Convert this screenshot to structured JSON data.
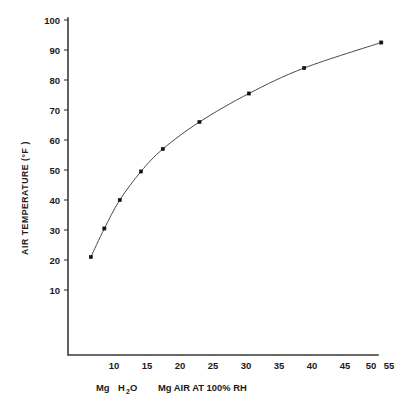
{
  "chart_data": {
    "type": "line",
    "title": "",
    "subtitle": "",
    "xlabel": "Mg  H2O      Mg  AIR AT  100% RH",
    "xlabel_parts": {
      "left_prefix": "Mg",
      "left_main": "H",
      "left_sub": "2",
      "left_suffix": "O",
      "right": "Mg  AIR AT  100% RH"
    },
    "ylabel": "AIR TEMPERATURE  (°F )",
    "xlim": [
      5.0,
      56.5
    ],
    "ylim": [
      5.0,
      101.5
    ],
    "xticks": [
      10,
      15,
      20,
      25,
      30,
      35,
      40,
      45,
      50,
      55
    ],
    "xticklabels": [
      "10",
      "15",
      "20",
      "25",
      "30",
      "35",
      "40",
      "45",
      "50",
      "55"
    ],
    "yticks": [
      10,
      20,
      30,
      40,
      50,
      60,
      70,
      80,
      90,
      100
    ],
    "yticklabels": [
      "10",
      "20",
      "30",
      "40",
      "50",
      "60",
      "70",
      "80",
      "90",
      "100"
    ],
    "grid": false,
    "legend": null,
    "legend_position": "none",
    "marker": "square",
    "line_color": "#4a4a4a",
    "marker_color": "#111111",
    "series": [
      {
        "name": "air temperature vs moisture content",
        "x": [
          6.4,
          8.5,
          10.9,
          14.2,
          17.6,
          23.3,
          31.0,
          39.6,
          51.6
        ],
        "y": [
          21.0,
          30.5,
          40.0,
          49.5,
          57.0,
          66.0,
          75.5,
          84.0,
          92.5
        ]
      }
    ]
  },
  "axes": {
    "y_axis_name": "air-temperature-axis",
    "x_axis_name": "moisture-content-axis"
  }
}
